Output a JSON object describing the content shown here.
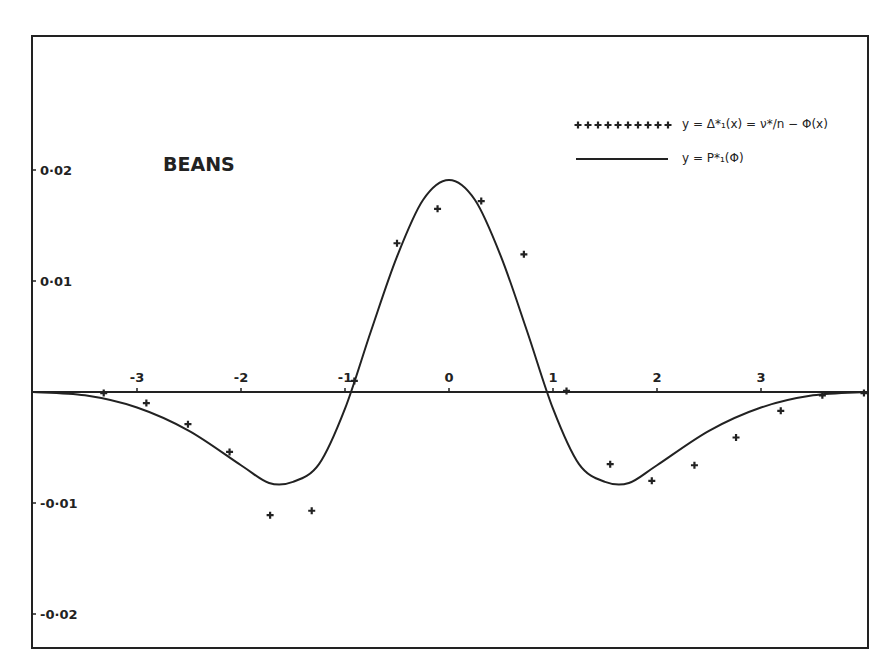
{
  "chart_data": {
    "type": "line",
    "title": "BEANS",
    "xlabel": "",
    "ylabel": "",
    "xlim": [
      -4.0,
      4.0
    ],
    "ylim": [
      -0.023,
      0.0255
    ],
    "grid": false,
    "legend_position": "upper right",
    "x_ticks": [
      -3,
      -2,
      -1,
      0,
      1,
      2,
      3
    ],
    "x_tick_labels": [
      "-3",
      "-2",
      "-1",
      "0",
      "1",
      "2",
      "3"
    ],
    "y_ticks": [
      0.02,
      0.01,
      -0.01,
      -0.02
    ],
    "y_tick_labels": [
      "0·02",
      "0·01",
      "-0·01",
      "-0·02"
    ],
    "series": [
      {
        "name": "y = Δ*₁(x) = ν*/n − Φ(x)",
        "style": "points",
        "marker": "+",
        "x": [
          -3.32,
          -2.91,
          -2.51,
          -2.11,
          -1.72,
          -1.32,
          -0.91,
          -0.5,
          -0.11,
          0.31,
          0.72,
          1.13,
          1.55,
          1.95,
          2.36,
          2.76,
          3.19,
          3.59,
          3.99
        ],
        "y": [
          -0.0001,
          -0.001,
          -0.0029,
          -0.0054,
          -0.0111,
          -0.0107,
          0.001,
          0.0134,
          0.0165,
          0.0172,
          0.0124,
          0.0001,
          -0.0065,
          -0.008,
          -0.0066,
          -0.0041,
          -0.0017,
          -0.0003,
          -0.0001
        ]
      },
      {
        "name": "y = P*₁(Φ)",
        "style": "line",
        "x": [
          -4.0,
          -3.5,
          -3.0,
          -2.5,
          -2.0,
          -1.73,
          -1.5,
          -1.25,
          -1.0,
          -0.75,
          -0.5,
          -0.25,
          0.0,
          0.25,
          0.5,
          0.75,
          1.0,
          1.25,
          1.5,
          1.73,
          2.0,
          2.5,
          3.0,
          3.5,
          4.0
        ],
        "y": [
          0.0,
          -0.0003,
          -0.0014,
          -0.0035,
          -0.0066,
          -0.0082,
          -0.0081,
          -0.0065,
          -0.0015,
          0.0055,
          0.0122,
          0.0173,
          0.0191,
          0.0173,
          0.0122,
          0.0055,
          -0.0015,
          -0.0065,
          -0.0081,
          -0.0082,
          -0.0066,
          -0.0035,
          -0.0014,
          -0.0003,
          0.0
        ]
      }
    ],
    "annotations": [
      "BEANS"
    ]
  },
  "legend": {
    "items": [
      {
        "marker": "plus-markers",
        "label": "y = Δ*₁(x) = ν*/n − Φ(x)"
      },
      {
        "marker": "solid-line",
        "label": "y = P*₁(Φ)"
      }
    ]
  },
  "colors": {
    "ink": "#222222",
    "background": "#ffffff"
  }
}
